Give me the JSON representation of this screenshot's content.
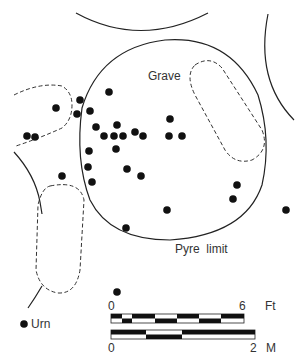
{
  "labels": {
    "grave": "Grave",
    "pyre_limit": "Pyre  limit",
    "legend_urn": "Urn",
    "scale_ft_start": "0",
    "scale_ft_end": "6",
    "scale_ft_unit": "Ft",
    "scale_m_start": "0",
    "scale_m_end": "2",
    "scale_m_unit": "M"
  },
  "colors": {
    "ink": "#111111",
    "background": "#ffffff"
  },
  "urns": [
    [
      109,
      92
    ],
    [
      80,
      100
    ],
    [
      56,
      108
    ],
    [
      77,
      114
    ],
    [
      90,
      111
    ],
    [
      27,
      136
    ],
    [
      35,
      137
    ],
    [
      96,
      127
    ],
    [
      117,
      125
    ],
    [
      104,
      136
    ],
    [
      114,
      136
    ],
    [
      123,
      136
    ],
    [
      135,
      132
    ],
    [
      143,
      136
    ],
    [
      170,
      119
    ],
    [
      169,
      136
    ],
    [
      182,
      136
    ],
    [
      89,
      151
    ],
    [
      116,
      149
    ],
    [
      88,
      167
    ],
    [
      127,
      169
    ],
    [
      141,
      176
    ],
    [
      92,
      182
    ],
    [
      62,
      176
    ],
    [
      237,
      185
    ],
    [
      233,
      199
    ],
    [
      167,
      210
    ],
    [
      286,
      210
    ],
    [
      126,
      228
    ],
    [
      117,
      292
    ]
  ]
}
